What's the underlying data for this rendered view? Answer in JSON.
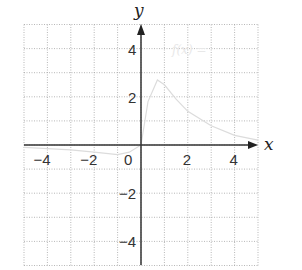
{
  "chart_data": {
    "type": "line",
    "title": "",
    "xlabel": "x",
    "ylabel": "y",
    "xlim": [
      -5,
      5
    ],
    "ylim": [
      -5,
      5
    ],
    "grid": true,
    "x_ticks": [
      "-4",
      "-2",
      "0",
      "2",
      "4"
    ],
    "y_ticks": [
      "4",
      "2",
      "-2",
      "-4"
    ],
    "annotation": "f(x) =",
    "series": [
      {
        "name": "f(x)",
        "x": [
          -5,
          -4,
          -3,
          -2,
          -1,
          -0.5,
          0,
          0.3,
          0.7,
          1,
          1.5,
          2,
          3,
          4,
          5
        ],
        "values": [
          -0.1,
          -0.15,
          -0.2,
          -0.3,
          -0.4,
          -0.3,
          0,
          1.8,
          2.7,
          2.5,
          1.9,
          1.4,
          0.8,
          0.4,
          0.2
        ]
      }
    ]
  }
}
